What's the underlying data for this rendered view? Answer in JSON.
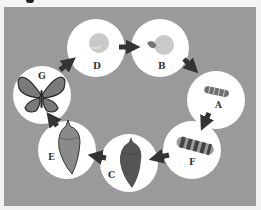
{
  "diagram": {
    "type": "life-cycle",
    "stages": [
      {
        "label": "D",
        "depicts": "egg",
        "cx": 96,
        "cy": 48
      },
      {
        "label": "B",
        "depicts": "hatching larva from egg",
        "cx": 160,
        "cy": 48
      },
      {
        "label": "A",
        "depicts": "small caterpillar",
        "cx": 216,
        "cy": 100
      },
      {
        "label": "F",
        "depicts": "large caterpillar",
        "cx": 192,
        "cy": 150
      },
      {
        "label": "C",
        "depicts": "chrysalis (dark)",
        "cx": 129,
        "cy": 163
      },
      {
        "label": "E",
        "depicts": "chrysalis (emerging, lighter)",
        "cx": 67,
        "cy": 150
      },
      {
        "label": "G",
        "depicts": "adult butterfly",
        "cx": 42,
        "cy": 95
      }
    ],
    "sequence": [
      "D",
      "B",
      "A",
      "F",
      "C",
      "E",
      "G",
      "D"
    ],
    "colors": {
      "background": "#9a9a9a",
      "circle": "#ffffff",
      "arrow": "#333333",
      "egg": "#c9c9c9",
      "caterpillar": "#6e6e6e",
      "chrysalis_dark": "#555555",
      "chrysalis_light": "#8a8a8a",
      "butterfly_wing": "#7a7a7a"
    }
  }
}
